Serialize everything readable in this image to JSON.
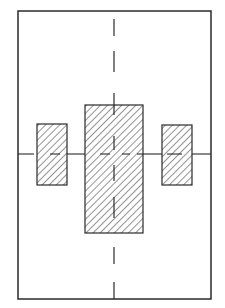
{
  "diagram": {
    "type": "technical-drawing",
    "colors": {
      "background": "#ffffff",
      "stroke": "#2a2a2a",
      "hatch": "#3a3a3a"
    },
    "frame": {
      "x": 18,
      "y": 11,
      "width": 193,
      "height": 288
    },
    "centerlines": {
      "vertical": {
        "x": 114,
        "dashes": [
          [
            19,
            36
          ],
          [
            51,
            72
          ],
          [
            93,
            115
          ],
          [
            136,
            150
          ],
          [
            165,
            181
          ],
          [
            197,
            218
          ],
          [
            247,
            264
          ],
          [
            282,
            299
          ]
        ]
      },
      "horizontal": {
        "y": 154,
        "segments": [
          [
            18,
            34
          ],
          [
            50,
            60
          ],
          [
            67,
            85
          ],
          [
            100,
            110
          ],
          [
            122,
            130
          ],
          [
            137,
            143
          ],
          [
            143,
            162
          ],
          [
            167,
            182
          ],
          [
            192,
            211
          ]
        ]
      }
    },
    "blocks": [
      {
        "name": "left-block",
        "x": 37,
        "y": 124,
        "width": 30,
        "height": 61
      },
      {
        "name": "center-block",
        "x": 85,
        "y": 105,
        "width": 58,
        "height": 128
      },
      {
        "name": "right-block",
        "x": 162,
        "y": 125,
        "width": 30,
        "height": 60
      }
    ]
  }
}
